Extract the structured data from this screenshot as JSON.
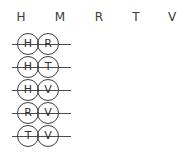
{
  "diagram": {
    "type": "crossed-out-pairs-chart",
    "header": {
      "letters": [
        "H",
        "M",
        "R",
        "T",
        "V"
      ]
    },
    "rows": [
      {
        "left": "H",
        "right": "R",
        "struck": "true"
      },
      {
        "left": "H",
        "right": "T",
        "struck": "true"
      },
      {
        "left": "H",
        "right": "V",
        "struck": "true"
      },
      {
        "left": "R",
        "right": "V",
        "struck": "true"
      },
      {
        "left": "T",
        "right": "V",
        "struck": "true"
      }
    ],
    "colors": {
      "background": "#ffffff",
      "ink": "#3d3d3d",
      "header_ink": "#3a3a3a",
      "strike": "#4a4a4a"
    }
  }
}
